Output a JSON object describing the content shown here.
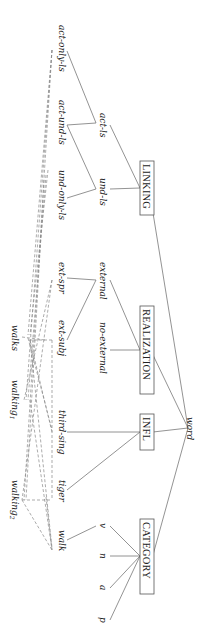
{
  "diagram": {
    "orientation": "rotated-90-clockwise",
    "root": "word",
    "dimensions": [
      {
        "name": "LINKING",
        "children": [
          {
            "name": "act-ls",
            "children": [
              "act-only-ls",
              "act-und-ls"
            ]
          },
          {
            "name": "und-ls",
            "children": [
              "act-und-ls",
              "und-only-ls"
            ]
          }
        ]
      },
      {
        "name": "REALIZATION",
        "children": [
          {
            "name": "external",
            "children": [
              "ext-spr",
              "ext-subj"
            ]
          },
          {
            "name": "no-external",
            "children": []
          }
        ]
      },
      {
        "name": "INFL",
        "children": [
          "third-sing",
          "tiger"
        ]
      },
      {
        "name": "CATEGORY",
        "children": [
          {
            "name": "v",
            "children": [
              "walk"
            ]
          },
          "n",
          "a",
          "p"
        ]
      }
    ],
    "lexical_entries": [
      "walks",
      "walking1",
      "walking2"
    ],
    "labels": {
      "word": "word",
      "linking": "LINKING",
      "realization": "REALIZATION",
      "infl": "INFL",
      "category": "CATEGORY",
      "act_ls": "act-ls",
      "und_ls": "und-ls",
      "act_only_ls": "act-only-ls",
      "act_und_ls": "act-und-ls",
      "und_only_ls": "und-only-ls",
      "external": "external",
      "no_external": "no-external",
      "ext_spr": "ext-spr",
      "ext_subj": "ext-subj",
      "third_sing": "third-sing",
      "tiger": "tiger",
      "walk": "walk",
      "v": "v",
      "n": "n",
      "a": "a",
      "p": "p",
      "walks": "walks",
      "walking1": "walking",
      "walking1_sub": "1",
      "walking2": "walking",
      "walking2_sub": "2"
    }
  }
}
